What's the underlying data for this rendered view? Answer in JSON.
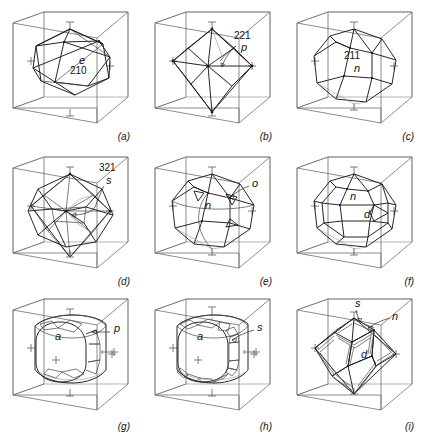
{
  "figure": {
    "title": "",
    "caption": "",
    "kind": "crystal-form-plate",
    "panel_count": 9,
    "columns": 3,
    "rows": 3,
    "background_color": "#ffffff",
    "line_color": "#1a1a1a",
    "cube_color": "#6e6e6e"
  },
  "panels": [
    {
      "id": "a",
      "letter": "(a)",
      "form_name": "pentagonal dodecahedron",
      "labels": [
        {
          "name": "form-symbol",
          "text": "e",
          "style": "italic",
          "x": 79,
          "y": 62
        },
        {
          "name": "miller-index",
          "text": "210",
          "style": "index",
          "x": 70,
          "y": 73
        }
      ],
      "axis_marks": [
        "top",
        "left",
        "right",
        "bottom"
      ],
      "leader": false
    },
    {
      "id": "b",
      "letter": "(b)",
      "form_name": "tristetrahedron",
      "labels": [
        {
          "name": "miller-index",
          "text": "221",
          "style": "index",
          "x": 92,
          "y": 38
        },
        {
          "name": "form-symbol",
          "text": "p",
          "style": "italic",
          "x": 99,
          "y": 49
        }
      ],
      "axis_marks": [
        "top",
        "left",
        "right",
        "bottom"
      ],
      "leader": true
    },
    {
      "id": "c",
      "letter": "(c)",
      "form_name": "trapezohedron",
      "labels": [
        {
          "name": "miller-index",
          "text": "211",
          "style": "index",
          "x": 60,
          "y": 58
        },
        {
          "name": "form-symbol",
          "text": "n",
          "style": "italic",
          "x": 70,
          "y": 70
        }
      ],
      "axis_marks": [
        "top",
        "left",
        "right",
        "bottom"
      ],
      "leader": false
    },
    {
      "id": "d",
      "letter": "(d)",
      "form_name": "hexoctahedron",
      "labels": [
        {
          "name": "miller-index",
          "text": "321",
          "style": "index",
          "x": 100,
          "y": 25
        },
        {
          "name": "form-symbol",
          "text": "s",
          "style": "italic",
          "x": 107,
          "y": 38
        }
      ],
      "axis_marks": [
        "top",
        "left",
        "right",
        "bottom"
      ],
      "leader": true
    },
    {
      "id": "e",
      "letter": "(e)",
      "form_name": "trapezohedron with octahedron",
      "labels": [
        {
          "name": "form-symbol-n",
          "text": "n",
          "style": "italic",
          "x": 63,
          "y": 62
        },
        {
          "name": "form-symbol-o",
          "text": "o",
          "style": "italic",
          "x": 110,
          "y": 37
        }
      ],
      "axis_marks": [
        "top",
        "left",
        "right",
        "bottom"
      ],
      "leader": true
    },
    {
      "id": "f",
      "letter": "(f)",
      "form_name": "trapezohedron with dodecahedron",
      "labels": [
        {
          "name": "form-symbol-n",
          "text": "n",
          "style": "italic",
          "x": 66,
          "y": 52
        },
        {
          "name": "form-symbol-d",
          "text": "d",
          "style": "italic",
          "x": 80,
          "y": 71
        }
      ],
      "axis_marks": [
        "top",
        "left",
        "right",
        "bottom"
      ],
      "leader": false
    },
    {
      "id": "g",
      "letter": "(g)",
      "form_name": "cube with pyritohedron",
      "labels": [
        {
          "name": "form-symbol-a",
          "text": "a",
          "style": "italic",
          "x": 55,
          "y": 48
        },
        {
          "name": "form-symbol-p",
          "text": "p",
          "style": "italic",
          "x": 114,
          "y": 40
        }
      ],
      "axis_marks": [
        "top",
        "left",
        "right",
        "bottom",
        "center"
      ],
      "leader": true
    },
    {
      "id": "h",
      "letter": "(h)",
      "form_name": "cube with hexoctahedron",
      "labels": [
        {
          "name": "form-symbol-a",
          "text": "a",
          "style": "italic",
          "x": 55,
          "y": 48
        },
        {
          "name": "form-symbol-s",
          "text": "s",
          "style": "italic",
          "x": 115,
          "y": 38
        }
      ],
      "axis_marks": [
        "top",
        "left",
        "right",
        "bottom",
        "center"
      ],
      "leader": true
    },
    {
      "id": "i",
      "letter": "(i)",
      "form_name": "dodecahedron with trapezohedron and hexoctahedron",
      "labels": [
        {
          "name": "form-symbol-s",
          "text": "s",
          "style": "italic",
          "x": 70,
          "y": 14
        },
        {
          "name": "form-symbol-n",
          "text": "n",
          "style": "italic",
          "x": 108,
          "y": 28
        },
        {
          "name": "form-symbol-d",
          "text": "d",
          "style": "italic",
          "x": 77,
          "y": 66
        }
      ],
      "axis_marks": [
        "top",
        "left",
        "right",
        "bottom"
      ],
      "leader": true
    }
  ]
}
